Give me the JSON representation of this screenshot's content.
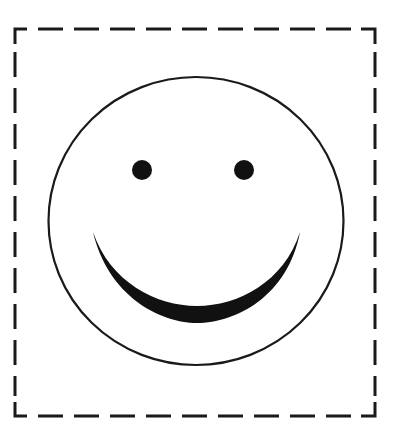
{
  "figure": {
    "border": {
      "style": "dashed",
      "color": "#1a1a1a"
    },
    "face": {
      "outline_color": "#1a1a1a",
      "fill": "#ffffff"
    },
    "eyes": {
      "color": "#111111"
    },
    "mouth": {
      "color": "#111111",
      "shape": "crescent-smile"
    }
  }
}
